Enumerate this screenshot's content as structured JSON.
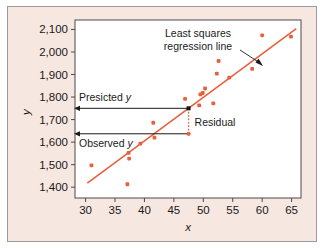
{
  "figure": {
    "panel_bg": "#f6e7e1",
    "panel_border": "#9a9a9a",
    "plot_bg": "#ffffff",
    "plot_border": "#4a4a4a"
  },
  "chart_data": {
    "type": "scatter",
    "title": "",
    "xlabel": "x",
    "ylabel": "y",
    "xlim": [
      28.2,
      66.6
    ],
    "ylim": [
      1352,
      2142
    ],
    "xticks": [
      30,
      35,
      40,
      45,
      50,
      55,
      60,
      65
    ],
    "xticklabels": [
      "30",
      "35",
      "40",
      "45",
      "50",
      "55",
      "60",
      "65"
    ],
    "yticks": [
      1400,
      1500,
      1600,
      1700,
      1800,
      1900,
      2000,
      2100
    ],
    "yticklabels": [
      "1,400",
      "1,500",
      "1,600",
      "1,700",
      "1,800",
      "1,900",
      "2,000",
      "2,100"
    ],
    "grid": false,
    "legend": "none",
    "point_color": "#e8603c",
    "line_color": "#e8603c",
    "points": [
      {
        "x": 31.0,
        "y": 1497
      },
      {
        "x": 37.1,
        "y": 1413
      },
      {
        "x": 37.3,
        "y": 1552
      },
      {
        "x": 37.4,
        "y": 1527
      },
      {
        "x": 39.3,
        "y": 1593
      },
      {
        "x": 41.5,
        "y": 1686
      },
      {
        "x": 41.7,
        "y": 1620
      },
      {
        "x": 46.9,
        "y": 1792
      },
      {
        "x": 47.5,
        "y": 1637
      },
      {
        "x": 49.3,
        "y": 1763
      },
      {
        "x": 49.5,
        "y": 1812
      },
      {
        "x": 49.9,
        "y": 1818
      },
      {
        "x": 50.3,
        "y": 1838
      },
      {
        "x": 51.7,
        "y": 1772
      },
      {
        "x": 52.3,
        "y": 1904
      },
      {
        "x": 52.6,
        "y": 1960
      },
      {
        "x": 54.4,
        "y": 1886
      },
      {
        "x": 58.3,
        "y": 1925
      },
      {
        "x": 60.0,
        "y": 2074
      },
      {
        "x": 64.9,
        "y": 2068
      }
    ],
    "regression_line": {
      "x_start": 30.3,
      "y_start": 1418,
      "x_end": 65.8,
      "y_end": 2104
    },
    "highlighted_point": {
      "x": 47.5,
      "y": 1750,
      "color": "#111111"
    },
    "annotations": [
      {
        "name": "least-squares-label",
        "line1": "Least squares",
        "line2": "regression line"
      },
      {
        "name": "predicted-y-label",
        "text": "Presicted ",
        "italic_suffix": "y",
        "value_y": 1750
      },
      {
        "name": "observed-y-label",
        "text": "Observed ",
        "italic_suffix": "y",
        "value_y": 1637
      },
      {
        "name": "residual-label",
        "text": "Residual"
      }
    ]
  }
}
